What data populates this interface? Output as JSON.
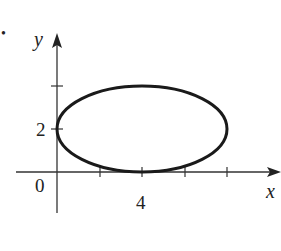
{
  "figure": {
    "bullet": "•",
    "axes": {
      "x_label": "x",
      "y_label": "y",
      "origin_label": "0",
      "x_tick_labels": [
        {
          "value": 4,
          "label": "4"
        }
      ],
      "y_tick_labels": [
        {
          "value": 2,
          "label": "2"
        }
      ],
      "x_ticks": [
        2,
        4,
        6,
        8
      ],
      "y_ticks": [
        2,
        4
      ]
    },
    "curve": {
      "type": "ellipse",
      "center": [
        4,
        2
      ],
      "semi_axis_x": 4,
      "semi_axis_y": 2,
      "color": "#1a1a1a"
    },
    "axis_color": "#333333"
  }
}
